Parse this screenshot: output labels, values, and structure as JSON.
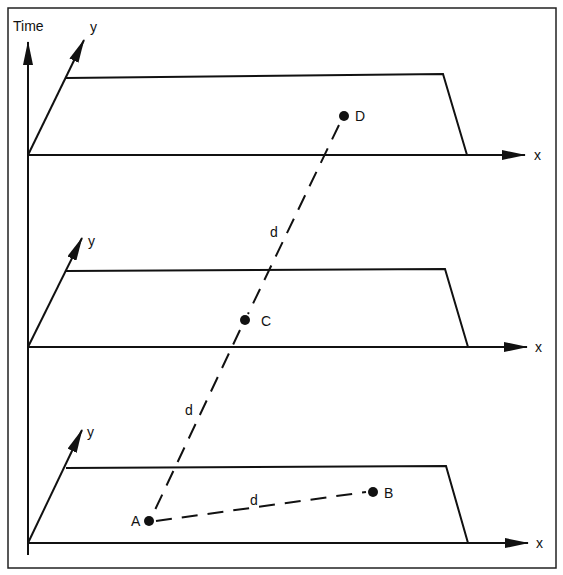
{
  "figure": {
    "type": "space-time diagram",
    "axes": {
      "time_label": "Time",
      "x_label": "x",
      "y_label": "y"
    },
    "planes": [
      {
        "id": "top",
        "x_label": "x",
        "y_label": "y"
      },
      {
        "id": "middle",
        "x_label": "x",
        "y_label": "y"
      },
      {
        "id": "bottom",
        "x_label": "x",
        "y_label": "y"
      }
    ],
    "points": [
      {
        "label": "A",
        "plane": "bottom"
      },
      {
        "label": "B",
        "plane": "bottom"
      },
      {
        "label": "C",
        "plane": "middle"
      },
      {
        "label": "D",
        "plane": "top"
      }
    ],
    "connections": [
      {
        "from": "A",
        "to": "B",
        "label": "d",
        "style": "dashed"
      },
      {
        "from": "A",
        "to": "C",
        "label": "d",
        "style": "dashed"
      },
      {
        "from": "C",
        "to": "D",
        "label": "d",
        "style": "dashed"
      }
    ],
    "colors": {
      "ink": "#111111",
      "background": "#ffffff"
    }
  }
}
